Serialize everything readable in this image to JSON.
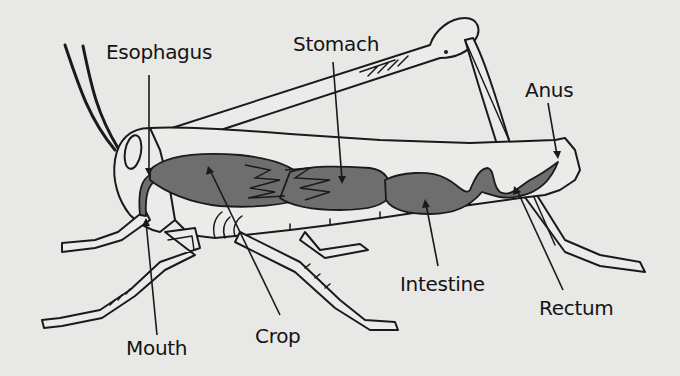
{
  "diagram": {
    "labels": [
      {
        "id": "esophagus",
        "text": "Esophagus"
      },
      {
        "id": "stomach",
        "text": "Stomach"
      },
      {
        "id": "anus",
        "text": "Anus"
      },
      {
        "id": "mouth",
        "text": "Mouth"
      },
      {
        "id": "crop",
        "text": "Crop"
      },
      {
        "id": "intestine",
        "text": "Intestine"
      },
      {
        "id": "rectum",
        "text": "Rectum"
      }
    ],
    "colors": {
      "background": "#e8e8e6",
      "organ_fill": "#6e6e6e",
      "outline": "#1a1a1a"
    }
  }
}
